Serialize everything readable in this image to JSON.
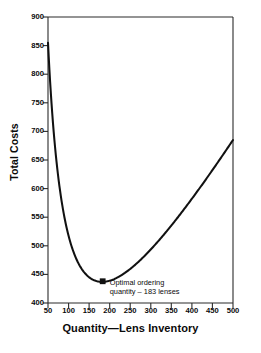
{
  "chart_data": {
    "type": "line",
    "title": "",
    "subtitle": "",
    "xlabel": "Quantity—Lens Inventory",
    "ylabel": "Total Costs",
    "xlim": [
      50,
      500
    ],
    "ylim": [
      400,
      900
    ],
    "grid": false,
    "legend": null,
    "xticks": [
      50,
      100,
      150,
      200,
      250,
      300,
      350,
      400,
      450,
      500
    ],
    "yticks": [
      400,
      450,
      500,
      550,
      600,
      650,
      700,
      750,
      800,
      850,
      900
    ],
    "xtick_labels": [
      "50",
      "100",
      "150",
      "200",
      "250",
      "300",
      "350",
      "400",
      "450",
      "500"
    ],
    "ytick_labels": [
      "400",
      "450",
      "500",
      "550",
      "600",
      "650",
      "700",
      "750",
      "800",
      "850",
      "900"
    ],
    "series": [
      {
        "name": "Total Costs",
        "x": [
          50,
          60,
          70,
          80,
          90,
          100,
          110,
          120,
          130,
          140,
          150,
          160,
          170,
          183,
          190,
          200,
          220,
          240,
          260,
          280,
          300,
          320,
          340,
          360,
          380,
          400,
          420,
          440,
          460,
          480,
          500
        ],
        "y": [
          855,
          775,
          716,
          672,
          638,
          611,
          590,
          573,
          559,
          549,
          541,
          535,
          531,
          528,
          528,
          529,
          533,
          540,
          549,
          560,
          572,
          585,
          598,
          612,
          627,
          641,
          656,
          671,
          686,
          701,
          716
        ]
      }
    ],
    "markers": [
      {
        "name": "optimal-order-quantity",
        "x": 183,
        "y": 438,
        "shape": "square",
        "label_lines": [
          "Optimal ordering",
          "quantity – 183 lenses"
        ]
      }
    ],
    "curve_values": {
      "start_x": 50,
      "start_y": 855,
      "min_x": 183,
      "min_y": 438,
      "end_x": 500,
      "end_y": 685
    },
    "colors": {
      "curve": "#111111",
      "axis": "#333333",
      "text": "#0a0a0a",
      "background": "#ffffff"
    }
  },
  "annotation": {
    "line1": "Optimal ordering",
    "line2": "quantity – 183 lenses"
  },
  "axes": {
    "x_title": "Quantity—Lens Inventory",
    "y_title": "Total Costs"
  }
}
